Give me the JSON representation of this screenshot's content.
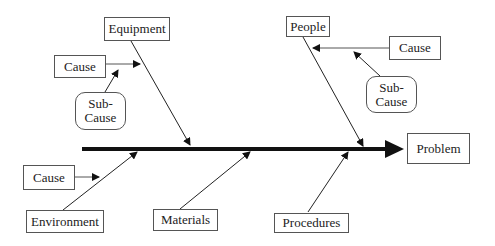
{
  "diagram": {
    "type": "fishbone",
    "problem": "Problem",
    "categories": {
      "equipment": "Equipment",
      "people": "People",
      "environment": "Environment",
      "materials": "Materials",
      "procedures": "Procedures"
    },
    "causes": {
      "equipment_cause": "Cause",
      "equipment_subcause": "Sub-\nCause",
      "people_cause": "Cause",
      "people_subcause": "Sub-\nCause",
      "environment_cause": "Cause"
    },
    "colors": {
      "line": "#222222",
      "border": "#555555",
      "background": "#ffffff"
    }
  }
}
